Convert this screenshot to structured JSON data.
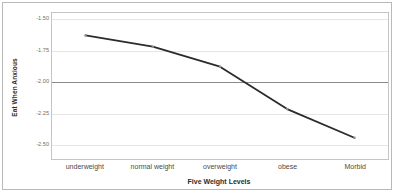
{
  "chart_data": {
    "type": "line",
    "title": "",
    "xlabel": "Five Weight Levels",
    "ylabel": "Eat When Anxious",
    "categories": [
      "underweight",
      "normal weight",
      "overweight",
      "obese",
      "Morbid"
    ],
    "values": [
      -1.63,
      -1.72,
      -1.88,
      -2.22,
      -2.45
    ],
    "series": [
      {
        "name": "Eat When Anxious",
        "values": [
          -1.63,
          -1.72,
          -1.88,
          -2.22,
          -2.45
        ]
      }
    ],
    "ylim": [
      -2.62,
      -1.45
    ],
    "yticks": [
      -1.5,
      -1.75,
      -2.0,
      -2.25,
      -2.5
    ],
    "ytick_labels": [
      "-1.50",
      "-1.75",
      "-2.00",
      "-2.25",
      "-2.50"
    ],
    "grid": true,
    "legend": "none",
    "reference_line": -2.0,
    "line_color": "#2b2b2b",
    "grid_color": "#e6e6e6",
    "reference_line_color": "#8a8a8a",
    "axis_color": "#c4c4c4"
  }
}
